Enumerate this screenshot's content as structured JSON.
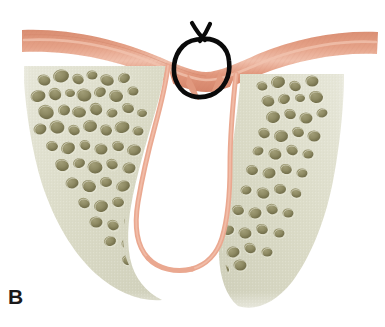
{
  "figure": {
    "panel_label": "B",
    "caption_text": "",
    "alt_description": "Cross-sectional anatomical illustration of an alveolar ridge showing a V-shaped bone defect lined with pink mucosa, overlying pink soft-tissue band, and a hand-drawn black circle annotation marking the soft tissue over the defect.",
    "background_color": "#ffffff"
  },
  "colors": {
    "mucosa_band": "#e09a80",
    "mucosa_band_dark": "#d68a6e",
    "mucosa_band_light": "#edb9a4",
    "mucosa_lining": "#eaa890",
    "bone_base": "#dcdcc8",
    "bone_base_light": "#e6e6d6",
    "bone_shadow": "#c9c9b2",
    "trabecular_space": "#8e8a63",
    "trabecular_space_dark": "#6f6b48",
    "annotation_stroke": "#0a0a0a",
    "panel_label_color": "#1a1a1a",
    "void_white": "#ffffff"
  },
  "structures": {
    "mucosa_band": {
      "name": "oral-mucosa-band",
      "description": "Horizontal pink soft-tissue band arching across the top, dipping toward the center"
    },
    "alveolar_bone": {
      "name": "alveolar-cancellous-bone",
      "description": "Pale greenish-cream cancellous bone mass forming a wide V silhouette"
    },
    "bone_defect": {
      "name": "v-shaped-bone-defect",
      "description": "White V-shaped cleft descending from the crest to a rounded apex, lined with pink mucosa"
    },
    "annotation_circle": {
      "name": "annotation-circle",
      "description": "Hand-drawn black circle with a small Y-shaped tail at its top, highlighting soft tissue collapsed into the defect"
    }
  },
  "geometry": {
    "canvas_width": 385,
    "canvas_height": 327,
    "annotation_circle_center_x": 203,
    "annotation_circle_center_y": 67,
    "annotation_circle_radius_x": 26,
    "annotation_circle_radius_y": 29,
    "panel_label_x": 8,
    "panel_label_y": 286
  },
  "trabecular_left": [
    {
      "cx": 44,
      "cy": 80,
      "rx": 6.5,
      "ry": 5.5,
      "rot": 15
    },
    {
      "cx": 61,
      "cy": 76,
      "rx": 8,
      "ry": 6.5,
      "rot": -10
    },
    {
      "cx": 78,
      "cy": 79,
      "rx": 6,
      "ry": 5,
      "rot": 25
    },
    {
      "cx": 92,
      "cy": 75,
      "rx": 5.5,
      "ry": 4.5,
      "rot": 0
    },
    {
      "cx": 107,
      "cy": 80,
      "rx": 7,
      "ry": 5.5,
      "rot": 18
    },
    {
      "cx": 124,
      "cy": 78,
      "rx": 6,
      "ry": 5,
      "rot": -20
    },
    {
      "cx": 38,
      "cy": 96,
      "rx": 7.5,
      "ry": 6,
      "rot": -12
    },
    {
      "cx": 55,
      "cy": 94,
      "rx": 6.5,
      "ry": 6,
      "rot": 30
    },
    {
      "cx": 70,
      "cy": 93,
      "rx": 5,
      "ry": 4,
      "rot": 0
    },
    {
      "cx": 84,
      "cy": 95,
      "rx": 7.5,
      "ry": 6.5,
      "rot": 12
    },
    {
      "cx": 100,
      "cy": 92,
      "rx": 6,
      "ry": 5,
      "rot": -25
    },
    {
      "cx": 116,
      "cy": 96,
      "rx": 7,
      "ry": 6,
      "rot": 8
    },
    {
      "cx": 133,
      "cy": 91,
      "rx": 5.5,
      "ry": 4.5,
      "rot": 0
    },
    {
      "cx": 46,
      "cy": 112,
      "rx": 8,
      "ry": 7,
      "rot": 20
    },
    {
      "cx": 64,
      "cy": 110,
      "rx": 6,
      "ry": 5.5,
      "rot": -15
    },
    {
      "cx": 79,
      "cy": 112,
      "rx": 7,
      "ry": 5.5,
      "rot": 5
    },
    {
      "cx": 96,
      "cy": 109,
      "rx": 6.5,
      "ry": 6,
      "rot": 28
    },
    {
      "cx": 112,
      "cy": 113,
      "rx": 5.5,
      "ry": 4.5,
      "rot": -8
    },
    {
      "cx": 128,
      "cy": 108,
      "rx": 6,
      "ry": 5,
      "rot": 14
    },
    {
      "cx": 142,
      "cy": 113,
      "rx": 5,
      "ry": 4,
      "rot": 0
    },
    {
      "cx": 40,
      "cy": 129,
      "rx": 6.5,
      "ry": 5.5,
      "rot": -18
    },
    {
      "cx": 57,
      "cy": 127,
      "rx": 7.5,
      "ry": 6.5,
      "rot": 10
    },
    {
      "cx": 74,
      "cy": 130,
      "rx": 6,
      "ry": 5,
      "rot": 22
    },
    {
      "cx": 90,
      "cy": 126,
      "rx": 7,
      "ry": 6,
      "rot": -5
    },
    {
      "cx": 106,
      "cy": 130,
      "rx": 6,
      "ry": 5.5,
      "rot": 16
    },
    {
      "cx": 122,
      "cy": 127,
      "rx": 7.5,
      "ry": 6,
      "rot": -12
    },
    {
      "cx": 138,
      "cy": 131,
      "rx": 5.5,
      "ry": 4.5,
      "rot": 0
    },
    {
      "cx": 52,
      "cy": 146,
      "rx": 6,
      "ry": 5,
      "rot": 8
    },
    {
      "cx": 68,
      "cy": 148,
      "rx": 7,
      "ry": 6,
      "rot": -20
    },
    {
      "cx": 85,
      "cy": 145,
      "rx": 5.5,
      "ry": 5,
      "rot": 25
    },
    {
      "cx": 101,
      "cy": 149,
      "rx": 6.5,
      "ry": 5.5,
      "rot": 0
    },
    {
      "cx": 118,
      "cy": 146,
      "rx": 6,
      "ry": 5,
      "rot": 14
    },
    {
      "cx": 134,
      "cy": 150,
      "rx": 7,
      "ry": 5.5,
      "rot": -10
    },
    {
      "cx": 150,
      "cy": 147,
      "rx": 5,
      "ry": 4,
      "rot": 0
    },
    {
      "cx": 62,
      "cy": 165,
      "rx": 7,
      "ry": 6,
      "rot": 18
    },
    {
      "cx": 79,
      "cy": 163,
      "rx": 6,
      "ry": 5,
      "rot": -15
    },
    {
      "cx": 95,
      "cy": 167,
      "rx": 7.5,
      "ry": 6.5,
      "rot": 5
    },
    {
      "cx": 112,
      "cy": 164,
      "rx": 6,
      "ry": 5,
      "rot": 22
    },
    {
      "cx": 129,
      "cy": 168,
      "rx": 6.5,
      "ry": 5.5,
      "rot": -8
    },
    {
      "cx": 146,
      "cy": 165,
      "rx": 5.5,
      "ry": 4.5,
      "rot": 12
    },
    {
      "cx": 72,
      "cy": 183,
      "rx": 6.5,
      "ry": 5.5,
      "rot": -12
    },
    {
      "cx": 89,
      "cy": 186,
      "rx": 7,
      "ry": 6,
      "rot": 16
    },
    {
      "cx": 106,
      "cy": 182,
      "rx": 6,
      "ry": 5,
      "rot": 0
    },
    {
      "cx": 123,
      "cy": 186,
      "rx": 7,
      "ry": 5.5,
      "rot": -22
    },
    {
      "cx": 140,
      "cy": 183,
      "rx": 5.5,
      "ry": 5,
      "rot": 10
    },
    {
      "cx": 156,
      "cy": 187,
      "rx": 5,
      "ry": 4,
      "rot": 0
    },
    {
      "cx": 84,
      "cy": 203,
      "rx": 6,
      "ry": 5,
      "rot": 20
    },
    {
      "cx": 101,
      "cy": 206,
      "rx": 7,
      "ry": 6,
      "rot": -10
    },
    {
      "cx": 118,
      "cy": 202,
      "rx": 6,
      "ry": 5,
      "rot": 8
    },
    {
      "cx": 135,
      "cy": 206,
      "rx": 6.5,
      "ry": 5.5,
      "rot": -18
    },
    {
      "cx": 152,
      "cy": 203,
      "rx": 5.5,
      "ry": 4.5,
      "rot": 14
    },
    {
      "cx": 96,
      "cy": 222,
      "rx": 6.5,
      "ry": 5.5,
      "rot": 0
    },
    {
      "cx": 113,
      "cy": 225,
      "rx": 6,
      "ry": 5,
      "rot": 22
    },
    {
      "cx": 131,
      "cy": 221,
      "rx": 7,
      "ry": 6,
      "rot": -12
    },
    {
      "cx": 148,
      "cy": 225,
      "rx": 5.5,
      "ry": 4.5,
      "rot": 6
    },
    {
      "cx": 110,
      "cy": 241,
      "rx": 6,
      "ry": 5,
      "rot": -15
    },
    {
      "cx": 128,
      "cy": 244,
      "rx": 6.5,
      "ry": 5.5,
      "rot": 10
    },
    {
      "cx": 146,
      "cy": 240,
      "rx": 6,
      "ry": 5,
      "rot": 0
    },
    {
      "cx": 163,
      "cy": 244,
      "rx": 5.5,
      "ry": 4.5,
      "rot": 18
    },
    {
      "cx": 128,
      "cy": 260,
      "rx": 6,
      "ry": 5,
      "rot": 12
    },
    {
      "cx": 147,
      "cy": 263,
      "rx": 6.5,
      "ry": 5.5,
      "rot": -8
    },
    {
      "cx": 165,
      "cy": 259,
      "rx": 6,
      "ry": 5,
      "rot": 20
    },
    {
      "cx": 183,
      "cy": 263,
      "rx": 5.5,
      "ry": 4.5,
      "rot": 0
    },
    {
      "cx": 150,
      "cy": 277,
      "rx": 6,
      "ry": 5,
      "rot": -10
    },
    {
      "cx": 169,
      "cy": 279,
      "rx": 6.5,
      "ry": 5.5,
      "rot": 14
    },
    {
      "cx": 188,
      "cy": 276,
      "rx": 6,
      "ry": 5,
      "rot": 0
    },
    {
      "cx": 206,
      "cy": 279,
      "rx": 5.5,
      "ry": 4.5,
      "rot": 16
    }
  ],
  "trabecular_right": [
    {
      "cx": 262,
      "cy": 86,
      "rx": 5.5,
      "ry": 4.5,
      "rot": 10
    },
    {
      "cx": 278,
      "cy": 82,
      "rx": 7,
      "ry": 6,
      "rot": -15
    },
    {
      "cx": 295,
      "cy": 86,
      "rx": 6,
      "ry": 5,
      "rot": 20
    },
    {
      "cx": 312,
      "cy": 81,
      "rx": 6.5,
      "ry": 5.5,
      "rot": 0
    },
    {
      "cx": 300,
      "cy": 98,
      "rx": 5,
      "ry": 4,
      "rot": 0
    },
    {
      "cx": 268,
      "cy": 101,
      "rx": 6.5,
      "ry": 5.5,
      "rot": 12
    },
    {
      "cx": 284,
      "cy": 99,
      "rx": 6,
      "ry": 5,
      "rot": -20
    },
    {
      "cx": 316,
      "cy": 97,
      "rx": 7,
      "ry": 6,
      "rot": 8
    },
    {
      "cx": 273,
      "cy": 117,
      "rx": 7,
      "ry": 6,
      "rot": -10
    },
    {
      "cx": 290,
      "cy": 114,
      "rx": 6,
      "ry": 5,
      "rot": 18
    },
    {
      "cx": 306,
      "cy": 118,
      "rx": 6.5,
      "ry": 5.5,
      "rot": 0
    },
    {
      "cx": 322,
      "cy": 113,
      "rx": 5.5,
      "ry": 4.5,
      "rot": -12
    },
    {
      "cx": 264,
      "cy": 133,
      "rx": 6,
      "ry": 5,
      "rot": 22
    },
    {
      "cx": 281,
      "cy": 136,
      "rx": 7,
      "ry": 6,
      "rot": -6
    },
    {
      "cx": 298,
      "cy": 132,
      "rx": 6,
      "ry": 5,
      "rot": 14
    },
    {
      "cx": 314,
      "cy": 136,
      "rx": 6.5,
      "ry": 5.5,
      "rot": 0
    },
    {
      "cx": 258,
      "cy": 151,
      "rx": 5.5,
      "ry": 4.5,
      "rot": -18
    },
    {
      "cx": 275,
      "cy": 154,
      "rx": 6.5,
      "ry": 5.5,
      "rot": 10
    },
    {
      "cx": 292,
      "cy": 150,
      "rx": 6,
      "ry": 5,
      "rot": 25
    },
    {
      "cx": 308,
      "cy": 154,
      "rx": 5.5,
      "ry": 4.5,
      "rot": 0
    },
    {
      "cx": 252,
      "cy": 170,
      "rx": 6,
      "ry": 5,
      "rot": 8
    },
    {
      "cx": 269,
      "cy": 173,
      "rx": 6.5,
      "ry": 5.5,
      "rot": -14
    },
    {
      "cx": 286,
      "cy": 169,
      "rx": 6,
      "ry": 5,
      "rot": 18
    },
    {
      "cx": 302,
      "cy": 173,
      "rx": 5.5,
      "ry": 4.5,
      "rot": 0
    },
    {
      "cx": 246,
      "cy": 190,
      "rx": 5.5,
      "ry": 4.5,
      "rot": -10
    },
    {
      "cx": 263,
      "cy": 193,
      "rx": 6.5,
      "ry": 5.5,
      "rot": 16
    },
    {
      "cx": 280,
      "cy": 189,
      "rx": 6,
      "ry": 5,
      "rot": 0
    },
    {
      "cx": 296,
      "cy": 193,
      "rx": 5.5,
      "ry": 4.5,
      "rot": 20
    },
    {
      "cx": 238,
      "cy": 210,
      "rx": 6,
      "ry": 5,
      "rot": 12
    },
    {
      "cx": 255,
      "cy": 213,
      "rx": 6.5,
      "ry": 5.5,
      "rot": -8
    },
    {
      "cx": 272,
      "cy": 209,
      "rx": 6,
      "ry": 5,
      "rot": 22
    },
    {
      "cx": 288,
      "cy": 213,
      "rx": 5.5,
      "ry": 4.5,
      "rot": 0
    },
    {
      "cx": 228,
      "cy": 230,
      "rx": 6,
      "ry": 5,
      "rot": -16
    },
    {
      "cx": 245,
      "cy": 233,
      "rx": 6.5,
      "ry": 5.5,
      "rot": 6
    },
    {
      "cx": 262,
      "cy": 229,
      "rx": 6,
      "ry": 5,
      "rot": 18
    },
    {
      "cx": 279,
      "cy": 233,
      "rx": 5.5,
      "ry": 4.5,
      "rot": 0
    },
    {
      "cx": 216,
      "cy": 249,
      "rx": 6,
      "ry": 5,
      "rot": 10
    },
    {
      "cx": 233,
      "cy": 252,
      "rx": 6.5,
      "ry": 5.5,
      "rot": -12
    },
    {
      "cx": 250,
      "cy": 248,
      "rx": 6,
      "ry": 5,
      "rot": 20
    },
    {
      "cx": 267,
      "cy": 252,
      "rx": 5.5,
      "ry": 4.5,
      "rot": 0
    },
    {
      "cx": 206,
      "cy": 266,
      "rx": 6,
      "ry": 5,
      "rot": -8
    },
    {
      "cx": 223,
      "cy": 269,
      "rx": 6,
      "ry": 5,
      "rot": 14
    },
    {
      "cx": 240,
      "cy": 265,
      "rx": 6.5,
      "ry": 5.5,
      "rot": 0
    },
    {
      "cx": 227,
      "cy": 282,
      "rx": 5.5,
      "ry": 4.5,
      "rot": 18
    }
  ]
}
